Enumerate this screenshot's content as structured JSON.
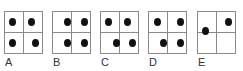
{
  "options": [
    {
      "label": "A",
      "left": 4,
      "dots": [
        [
          4,
          6
        ],
        [
          23,
          6
        ],
        [
          4,
          27
        ],
        [
          27,
          27
        ]
      ]
    },
    {
      "label": "B",
      "left": 52,
      "dots": [
        [
          11,
          6
        ],
        [
          28,
          6
        ],
        [
          11,
          27
        ],
        [
          28,
          27
        ]
      ]
    },
    {
      "label": "C",
      "left": 100,
      "dots": [
        [
          4,
          6
        ],
        [
          23,
          6
        ],
        [
          12,
          27
        ],
        [
          28,
          27
        ]
      ]
    },
    {
      "label": "D",
      "left": 148,
      "dots": [
        [
          5,
          6
        ],
        [
          28,
          6
        ],
        [
          11,
          27
        ],
        [
          28,
          27
        ]
      ]
    },
    {
      "label": "E",
      "left": 197,
      "dots": [
        [
          4,
          15
        ],
        [
          27,
          6
        ]
      ]
    }
  ]
}
